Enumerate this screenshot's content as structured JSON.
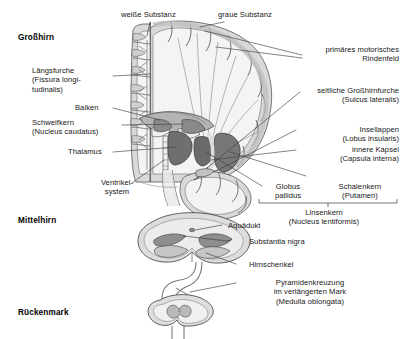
{
  "figure": {
    "language": "de"
  },
  "regions": [
    {
      "name": "cerebrum",
      "label": "Großhirn"
    },
    {
      "name": "midbrain",
      "label": "Mittelhirn"
    },
    {
      "name": "spinal-cord",
      "label": "Rückenmark"
    }
  ],
  "labels": {
    "weisse_substanz": "weiße Substanz",
    "graue_substanz": "graue Substanz",
    "laengsfurche": "Längsfurche\n(Fissura longi-\ntudinalis)",
    "balken": "Balken",
    "schweifkern": "Schweifkern\n(Nucleus caudatus)",
    "thalamus": "Thalamus",
    "ventrikelsystem": "Ventrikel-\nsystem",
    "primaeres_motorisches_rindenfeld": "primäres motorisches\nRindenfeld",
    "seitliche_grosshirnfurche": "seitliche Großhirnfurche\n(Sulcus lateralis)",
    "insellappen": "Insellappen\n(Lobus insularis)",
    "innere_kapsel": "innere Kapsel\n(Capsula interna)",
    "globus_pallidus": "Globus\npallidus",
    "schalenkern": "Schalenkern\n(Putamen)",
    "linsenkern": "Linsenkern\n(Nucleus lentiformis)",
    "aquaedukt": "Aquädukt",
    "substantia_nigra": "Substantia nigra",
    "hirnschenkel": "Hirnschenkel",
    "pyramidenkreuzung": "Pyramidenkreuzung\nim verlängerten Mark\n(Medulla oblongata)"
  },
  "colors": {
    "background": "#ffffff",
    "text": "#171717",
    "leader_line": "#444444",
    "outline": "#4a4a4a",
    "white_matter": "#f3f3f3",
    "gray_matter": "#c9c9c9",
    "gray_matter_light": "#d8d8d8",
    "nucleus_dark": "#6e6e6e",
    "nucleus_mid": "#9a9a9a",
    "ventricle": "#ededed"
  }
}
